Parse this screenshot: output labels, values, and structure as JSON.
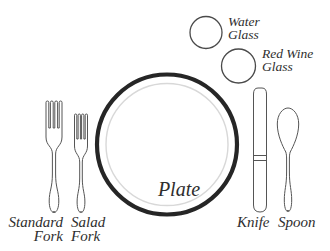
{
  "canvas": {
    "width": 330,
    "height": 251,
    "background": "#ffffff"
  },
  "colors": {
    "outline": "#555555",
    "plate_ring": "#262626",
    "plate_inner": "#d8d8d8",
    "text": "#2e2e2e"
  },
  "diagram": {
    "type": "table-place-setting",
    "labels": {
      "water_glass": "Water\nGlass",
      "red_wine_glass": "Red Wine\nGlass",
      "plate": "Plate",
      "standard_fork": "Standard\nFork",
      "salad_fork": "Salad\nFork",
      "knife": "Knife",
      "spoon": "Spoon"
    }
  }
}
